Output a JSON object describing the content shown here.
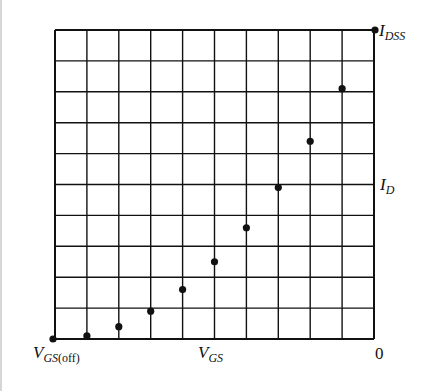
{
  "chart_data": {
    "type": "scatter",
    "title": "",
    "xlabel": "V_GS",
    "ylabel": "I_D",
    "x_grid_divisions": 10,
    "y_grid_divisions": 10,
    "grid": true,
    "x_range_label": {
      "left": "V_GS(off)",
      "right": "0"
    },
    "y_range_label": {
      "top": "I_DSS"
    },
    "x": [
      0,
      1,
      2,
      3,
      4,
      5,
      6,
      7,
      8,
      9,
      10
    ],
    "x_units": "grid divisions from V_GS(off) (0) to V_GS = 0 (10)",
    "y": [
      0,
      0.1,
      0.4,
      0.9,
      1.6,
      2.5,
      3.6,
      4.9,
      6.4,
      8.1,
      10
    ],
    "y_units": "grid divisions (10 = I_DSS)",
    "y_normalized": [
      0,
      0.01,
      0.04,
      0.09,
      0.16,
      0.25,
      0.36,
      0.49,
      0.64,
      0.81,
      1.0
    ],
    "xlim": [
      0,
      10
    ],
    "ylim": [
      0,
      10
    ]
  },
  "labels": {
    "idss_main": "I",
    "idss_sub": "DSS",
    "id_main": "I",
    "id_sub": "D",
    "vgsoff_main": "V",
    "vgsoff_sub_italic": "GS",
    "vgsoff_sub_upright": "(off)",
    "vgs_main": "V",
    "vgs_sub": "GS",
    "zero": "0"
  },
  "colors": {
    "ink": "#111111",
    "background": "#ffffff"
  }
}
